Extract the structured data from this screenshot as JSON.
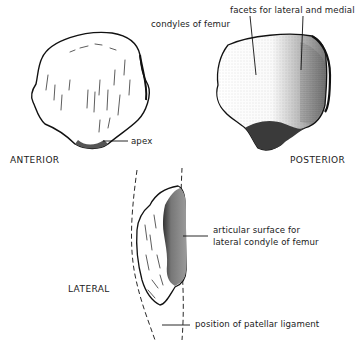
{
  "figure": {
    "subject": "patella",
    "views": {
      "anterior": "ANTERIOR",
      "posterior": "POSTERIOR",
      "lateral": "LATERAL"
    },
    "labels": {
      "apex": "apex",
      "facets_line1": "facets for lateral and medial",
      "facets_line2": "condyles of femur",
      "articular_line1": "articular surface for",
      "articular_line2": "lateral condyle of femur",
      "ligament": "position of patellar ligament"
    }
  }
}
